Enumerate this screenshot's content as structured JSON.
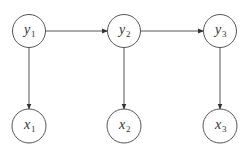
{
  "diagram": {
    "type": "hidden-markov-model",
    "colors": {
      "stroke": "#555555",
      "text": "#333333",
      "background": "#ffffff"
    },
    "nodes": [
      {
        "id": "y1",
        "var": "y",
        "sub": "1",
        "cx": 29,
        "cy": 31,
        "r": 16.5
      },
      {
        "id": "y2",
        "var": "y",
        "sub": "2",
        "cx": 124,
        "cy": 31,
        "r": 16.5
      },
      {
        "id": "y3",
        "var": "y",
        "sub": "3",
        "cx": 220,
        "cy": 31,
        "r": 16.5
      },
      {
        "id": "x1",
        "var": "x",
        "sub": "1",
        "cx": 29,
        "cy": 126,
        "r": 17
      },
      {
        "id": "x2",
        "var": "x",
        "sub": "2",
        "cx": 124,
        "cy": 126,
        "r": 17
      },
      {
        "id": "x3",
        "var": "x",
        "sub": "3",
        "cx": 220,
        "cy": 126,
        "r": 17
      }
    ],
    "edges": [
      {
        "from": "y1",
        "to": "y2"
      },
      {
        "from": "y2",
        "to": "y3"
      },
      {
        "from": "y1",
        "to": "x1"
      },
      {
        "from": "y2",
        "to": "x2"
      },
      {
        "from": "y3",
        "to": "x3"
      }
    ]
  }
}
